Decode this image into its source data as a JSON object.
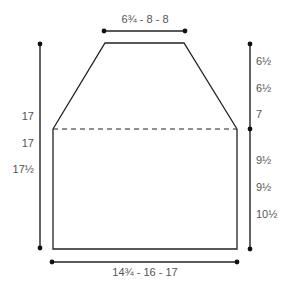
{
  "diagram": {
    "type": "garment schematic",
    "colors": {
      "line": "#222222",
      "text": "#555555"
    },
    "top_width": "6¾ - 8 - 8",
    "bottom_width": "14¾ - 16 - 17",
    "left_total_length": [
      "17",
      "17",
      "17½"
    ],
    "right_upper_length": [
      "6½",
      "6½",
      "7"
    ],
    "right_lower_length": [
      "9½",
      "9½",
      "10½"
    ]
  }
}
